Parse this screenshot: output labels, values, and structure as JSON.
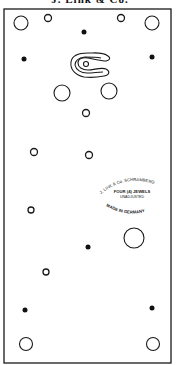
{
  "title": "J. Link & Co.",
  "plate": {
    "x": 4,
    "y": 9,
    "width": 167,
    "height": 354,
    "stroke": "#1a1a1a"
  },
  "stamp": {
    "line_top_arc": "J. LINK & Co. SCHRAMBERG",
    "line_1": "FOUR (4) JEWELS",
    "line_2": "UNADJUSTED",
    "line_bottom_arc": "MADE IN GERMANY"
  },
  "features": {
    "large_holes": [
      {
        "cx": 21,
        "cy": 23,
        "r": 7
      },
      {
        "cx": 152,
        "cy": 23,
        "r": 7
      },
      {
        "cx": 62,
        "cy": 93,
        "r": 8
      },
      {
        "cx": 109,
        "cy": 91,
        "r": 8
      },
      {
        "cx": 134,
        "cy": 238,
        "r": 10
      },
      {
        "cx": 26,
        "cy": 344,
        "r": 6.5
      },
      {
        "cx": 153,
        "cy": 344,
        "r": 6.5
      }
    ],
    "small_holes": [
      {
        "cx": 48,
        "cy": 18,
        "r": 3.5
      },
      {
        "cx": 121,
        "cy": 18,
        "r": 3.5
      },
      {
        "cx": 86,
        "cy": 113,
        "r": 3.5
      },
      {
        "cx": 34,
        "cy": 152,
        "r": 3.5
      },
      {
        "cx": 89,
        "cy": 155,
        "r": 3.5
      },
      {
        "cx": 31,
        "cy": 210,
        "r": 3
      },
      {
        "cx": 46,
        "cy": 272,
        "r": 3
      }
    ],
    "pins": [
      {
        "cx": 84,
        "cy": 32,
        "r": 2.5
      },
      {
        "cx": 24,
        "cy": 59,
        "r": 2.5
      },
      {
        "cx": 152,
        "cy": 57,
        "r": 2.5
      },
      {
        "cx": 88,
        "cy": 247,
        "r": 2.5
      },
      {
        "cx": 25,
        "cy": 310,
        "r": 2.5
      },
      {
        "cx": 152,
        "cy": 308,
        "r": 2.5
      }
    ],
    "hairspring_slot": {
      "center_hole": {
        "cx": 86,
        "cy": 64,
        "r": 2.5
      }
    }
  }
}
